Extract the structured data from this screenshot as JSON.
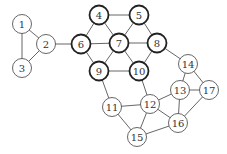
{
  "diagram": {
    "type": "graph",
    "node_radius": 9.5,
    "nodes": [
      {
        "id": "1",
        "x": 22,
        "y": 24,
        "bold": false
      },
      {
        "id": "2",
        "x": 46,
        "y": 44,
        "bold": false
      },
      {
        "id": "3",
        "x": 22,
        "y": 68,
        "bold": false
      },
      {
        "id": "4",
        "x": 99,
        "y": 15,
        "bold": true
      },
      {
        "id": "5",
        "x": 139,
        "y": 15,
        "bold": true
      },
      {
        "id": "6",
        "x": 81,
        "y": 44,
        "bold": true
      },
      {
        "id": "7",
        "x": 119,
        "y": 43,
        "bold": true
      },
      {
        "id": "8",
        "x": 157,
        "y": 43,
        "bold": true
      },
      {
        "id": "9",
        "x": 99,
        "y": 71,
        "bold": true
      },
      {
        "id": "10",
        "x": 139,
        "y": 71,
        "bold": true
      },
      {
        "id": "11",
        "x": 112,
        "y": 107,
        "bold": false
      },
      {
        "id": "12",
        "x": 150,
        "y": 104,
        "bold": false
      },
      {
        "id": "13",
        "x": 180,
        "y": 90,
        "bold": false
      },
      {
        "id": "14",
        "x": 188,
        "y": 64,
        "bold": false
      },
      {
        "id": "15",
        "x": 137,
        "y": 137,
        "bold": false
      },
      {
        "id": "16",
        "x": 178,
        "y": 123,
        "bold": false
      },
      {
        "id": "17",
        "x": 209,
        "y": 90,
        "bold": false
      }
    ],
    "edges": [
      [
        "1",
        "2"
      ],
      [
        "1",
        "3"
      ],
      [
        "2",
        "3"
      ],
      [
        "2",
        "6"
      ],
      [
        "4",
        "5"
      ],
      [
        "4",
        "6"
      ],
      [
        "4",
        "7"
      ],
      [
        "5",
        "7"
      ],
      [
        "5",
        "8"
      ],
      [
        "6",
        "7"
      ],
      [
        "7",
        "8"
      ],
      [
        "6",
        "9"
      ],
      [
        "7",
        "9"
      ],
      [
        "7",
        "10"
      ],
      [
        "9",
        "10"
      ],
      [
        "8",
        "10"
      ],
      [
        "8",
        "14"
      ],
      [
        "14",
        "13"
      ],
      [
        "14",
        "17"
      ],
      [
        "13",
        "17"
      ],
      [
        "13",
        "16"
      ],
      [
        "12",
        "13"
      ],
      [
        "16",
        "17"
      ],
      [
        "9",
        "11"
      ],
      [
        "10",
        "12"
      ],
      [
        "11",
        "12"
      ],
      [
        "11",
        "15"
      ],
      [
        "12",
        "15"
      ],
      [
        "12",
        "16"
      ],
      [
        "15",
        "16"
      ]
    ]
  }
}
